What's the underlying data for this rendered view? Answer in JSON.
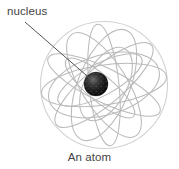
{
  "figure": {
    "title": "An atom",
    "caption": "An atom",
    "labels": {
      "nucleus": "nucleus"
    },
    "colors": {
      "background": "#ffffff",
      "text": "#444444",
      "leader_line": "#555555",
      "orbit_ring": "#b9b9b9",
      "sphere_outline": "#cfcfcf",
      "nucleus_dark": "#111111",
      "nucleus_mid": "#3a3a3a",
      "nucleus_light": "#6e6e6e"
    },
    "geometry": {
      "sphere_center_x": 104,
      "sphere_center_y": 85,
      "sphere_radius": 64,
      "nucleus_center_x": 96,
      "nucleus_center_y": 84,
      "nucleus_radius": 12,
      "leader_start_x": 25,
      "leader_start_y": 22,
      "leader_end_x": 90,
      "leader_end_y": 79,
      "orbit_count": 8
    }
  }
}
